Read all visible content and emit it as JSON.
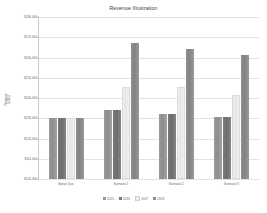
{
  "chart_data": {
    "type": "bar",
    "title": "Revenue Illustration",
    "xlabel": "",
    "ylabel": "Revenue\n(USD)",
    "categories": [
      "Status Quo",
      "Scenario 1",
      "Scenario 2",
      "Scenario 3"
    ],
    "series": [
      {
        "name": "2015",
        "color": "#9a9a9a",
        "values": [
          130000,
          134000,
          132000,
          130500
        ]
      },
      {
        "name": "2016",
        "color": "#7a7a7a",
        "values": [
          130000,
          134000,
          132000,
          130500
        ]
      },
      {
        "name": "2017",
        "color": "#ededed",
        "values": [
          129800,
          145000,
          145000,
          141000
        ]
      },
      {
        "name": "2018",
        "color": "#8f8f8f",
        "values": [
          130000,
          167000,
          164000,
          161000
        ]
      }
    ],
    "ylim": [
      100000,
      180000
    ],
    "ytick_labels": [
      "$180,000",
      "$170,000",
      "$160,000",
      "$150,000",
      "$140,000",
      "$130,000",
      "$120,000",
      "$110,000",
      "$100,000"
    ],
    "ytick_values": [
      180000,
      170000,
      160000,
      150000,
      140000,
      130000,
      120000,
      110000,
      100000
    ],
    "grid": true,
    "legend_position": "bottom"
  }
}
